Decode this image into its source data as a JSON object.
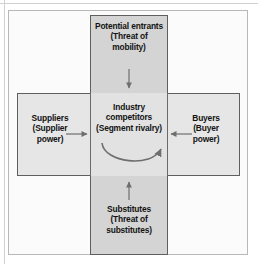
{
  "diagram": {
    "type": "five-forces-cross",
    "colors": {
      "frame_border": "#b8b8b8",
      "box_border": "#5f5f5f",
      "vertical_fill": "#d4d4d4",
      "horizontal_fill": "#d9d9d9",
      "center_fill": "#e2e2e2",
      "side_cell_fill": "#e6e6e6",
      "text": "#131313",
      "arrow": "#6e6e6e",
      "page_background": "#ffffff"
    },
    "boxes": {
      "top": {
        "label": "Potential entrants\n(Threat of\nmobility)",
        "line1": "Potential entrants",
        "line2": "(Threat of",
        "line3": "mobility)"
      },
      "center": {
        "label": "Industry\ncompetitors\n(Segment rivalry)",
        "line1": "Industry",
        "line2": "competitors",
        "line3": "(Segment rivalry)"
      },
      "left": {
        "label": "Suppliers\n(Supplier\npower)",
        "line1": "Suppliers",
        "line2": "(Supplier",
        "line3": "power)"
      },
      "right": {
        "label": "Buyers\n(Buyer\npower)",
        "line1": "Buyers",
        "line2": "(Buyer",
        "line3": "power)"
      },
      "bottom": {
        "label": "Substitutes\n(Threat of\nsubstitutes)",
        "line1": "Substitutes",
        "line2": "(Threat of",
        "line3": "substitutes)"
      }
    },
    "arrows": [
      {
        "name": "arrow-top-down",
        "from": "top",
        "to": "center",
        "direction": "down"
      },
      {
        "name": "arrow-bottom-up",
        "from": "bottom",
        "to": "center",
        "direction": "up"
      },
      {
        "name": "arrow-left-right",
        "from": "left",
        "to": "center",
        "direction": "right"
      },
      {
        "name": "arrow-right-left",
        "from": "right",
        "to": "center",
        "direction": "left"
      },
      {
        "name": "arrow-rivalry-curve",
        "from": "center",
        "to": "center",
        "direction": "curved-clockwise"
      }
    ]
  }
}
